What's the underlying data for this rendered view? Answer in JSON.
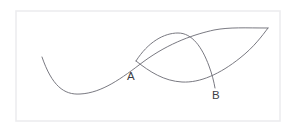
{
  "figure": {
    "background_color": "#ffffff",
    "frame": {
      "name": "diagram-border",
      "x": 16,
      "y": 11,
      "width": 264,
      "height": 110,
      "stroke_color": "#ededef",
      "stroke_width": 1.6
    },
    "curve_color": "#72727a",
    "curve_width": 0.95,
    "label_color": "#3d3d44"
  },
  "labels": [
    {
      "id": "A",
      "text": "A",
      "x": 131,
      "y": 80,
      "describes": "first intersection of the two curves"
    },
    {
      "id": "B",
      "text": "B",
      "x": 216,
      "y": 99,
      "describes": "second intersection of the two curves"
    }
  ],
  "chart_data": {
    "type": "line",
    "xlabel": "",
    "ylabel": "",
    "grid": false,
    "legend": "none",
    "axes_visible": false,
    "xlim": [
      16,
      280
    ],
    "ylim": [
      11,
      121
    ],
    "annotations": [
      {
        "text": "A",
        "x": 131,
        "y": 80
      },
      {
        "text": "B",
        "x": 216,
        "y": 99
      }
    ],
    "intersections": [
      {
        "label": "A",
        "x": 136,
        "y": 61
      },
      {
        "label": "B",
        "x": 209,
        "y": 72
      }
    ],
    "series": [
      {
        "name": "s-curve",
        "description": "Cubic S-shaped curve entering at upper left, dipping to a minimum then rising to the upper right",
        "path": "M 42 57 C 52 86, 64 95, 80 94 C 102 93, 122 78, 143 62 C 170 42, 196 34, 214 30 C 230 27, 245 28, 268 28",
        "points": [
          {
            "x": 42,
            "y": 57
          },
          {
            "x": 58,
            "y": 84
          },
          {
            "x": 80,
            "y": 94
          },
          {
            "x": 104,
            "y": 91
          },
          {
            "x": 122,
            "y": 78
          },
          {
            "x": 136,
            "y": 61
          },
          {
            "x": 160,
            "y": 47
          },
          {
            "x": 186,
            "y": 37
          },
          {
            "x": 209,
            "y": 72
          },
          {
            "x": 240,
            "y": 31
          },
          {
            "x": 268,
            "y": 28
          }
        ]
      },
      {
        "name": "arc-curve",
        "description": "Hump-shaped arc starting at point A, rising to a peak then descending past point B",
        "path": "M 136 61 C 148 42, 164 33, 178 33 C 192 33, 202 47, 209 66 C 212 74, 214 82, 215 88",
        "points": [
          {
            "x": 136,
            "y": 61
          },
          {
            "x": 152,
            "y": 40
          },
          {
            "x": 166,
            "y": 33
          },
          {
            "x": 178,
            "y": 33
          },
          {
            "x": 192,
            "y": 39
          },
          {
            "x": 203,
            "y": 55
          },
          {
            "x": 209,
            "y": 72
          },
          {
            "x": 215,
            "y": 88
          }
        ]
      },
      {
        "name": "lower-arc-curve",
        "description": "Shallow concave arc from point A dipping to a trough then rising through point B to the right edge",
        "path": "M 136 61 C 150 72, 164 81, 182 82 C 200 83, 220 74, 240 58 C 254 47, 262 36, 268 28",
        "points": [
          {
            "x": 136,
            "y": 61
          },
          {
            "x": 152,
            "y": 73
          },
          {
            "x": 168,
            "y": 80
          },
          {
            "x": 184,
            "y": 82
          },
          {
            "x": 200,
            "y": 78
          },
          {
            "x": 209,
            "y": 72
          },
          {
            "x": 228,
            "y": 66
          },
          {
            "x": 248,
            "y": 49
          },
          {
            "x": 268,
            "y": 28
          }
        ]
      }
    ]
  }
}
